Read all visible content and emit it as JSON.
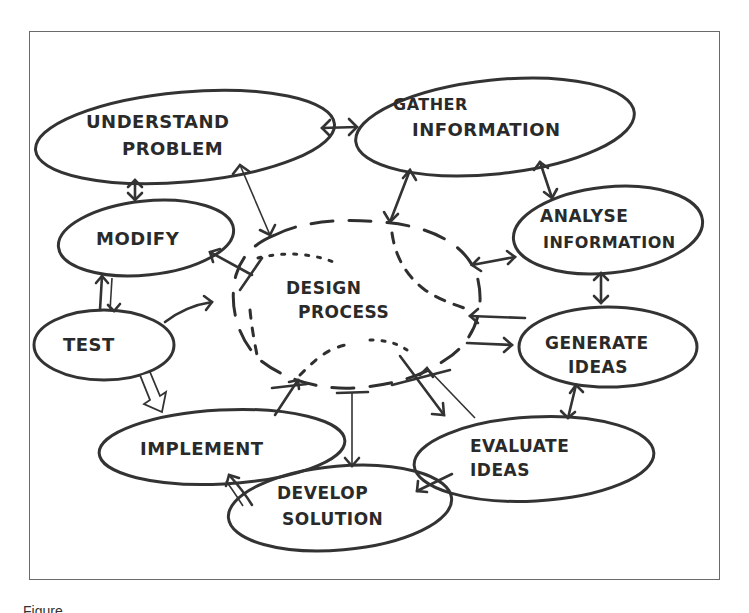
{
  "diagram": {
    "center": {
      "line1": "DESIGN",
      "line2": "PROCESS"
    },
    "nodes": [
      {
        "id": "understand",
        "line1": "UNDERSTAND",
        "line2": "PROBLEM"
      },
      {
        "id": "gather",
        "line1": "GATHER",
        "line2": "INFORMATION"
      },
      {
        "id": "analyse",
        "line1": "ANALYSE",
        "line2": "INFORMATION"
      },
      {
        "id": "generate",
        "line1": "GENERATE",
        "line2": "IDEAS"
      },
      {
        "id": "evaluate",
        "line1": "EVALUATE",
        "line2": "IDEAS"
      },
      {
        "id": "develop",
        "line1": "DEVELOP",
        "line2": "SOLUTION"
      },
      {
        "id": "implement",
        "line1": "IMPLEMENT",
        "line2": ""
      },
      {
        "id": "test",
        "line1": "TEST",
        "line2": ""
      },
      {
        "id": "modify",
        "line1": "MODIFY",
        "line2": ""
      }
    ],
    "edges": [
      {
        "from": "understand",
        "to": "gather",
        "type": "double"
      },
      {
        "from": "understand",
        "to": "modify",
        "type": "double"
      },
      {
        "from": "understand",
        "to": "design process",
        "type": "double"
      },
      {
        "from": "gather",
        "to": "analyse",
        "type": "double"
      },
      {
        "from": "gather",
        "to": "design process",
        "type": "double"
      },
      {
        "from": "analyse",
        "to": "generate",
        "type": "double"
      },
      {
        "from": "analyse",
        "to": "design process",
        "type": "double"
      },
      {
        "from": "generate",
        "to": "evaluate",
        "type": "double"
      },
      {
        "from": "generate",
        "to": "design process",
        "type": "double"
      },
      {
        "from": "evaluate",
        "to": "develop",
        "type": "single"
      },
      {
        "from": "evaluate",
        "to": "design process",
        "type": "double"
      },
      {
        "from": "develop",
        "to": "implement",
        "type": "single"
      },
      {
        "from": "design process",
        "to": "develop",
        "type": "single"
      },
      {
        "from": "implement",
        "to": "design process",
        "type": "single"
      },
      {
        "from": "test",
        "to": "implement",
        "type": "hollow"
      },
      {
        "from": "test",
        "to": "modify",
        "type": "double"
      },
      {
        "from": "test",
        "to": "design process",
        "type": "single"
      },
      {
        "from": "design process",
        "to": "modify",
        "type": "single"
      }
    ]
  },
  "caption": {
    "text": "Figure"
  }
}
